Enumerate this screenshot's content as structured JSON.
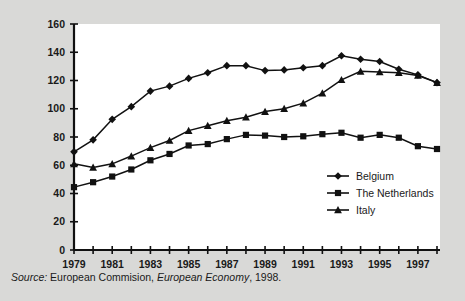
{
  "figure": {
    "background_color": "#d9d9d7",
    "plot_background_color": "#ffffff",
    "line_color": "#111111"
  },
  "source_note": {
    "prefix": "Source:",
    "body": " European Commision, ",
    "publication": "European Economy",
    "suffix": ", 1998."
  },
  "legend": {
    "position": "inside-right-lower",
    "entries": [
      {
        "label": "Belgium",
        "marker": "diamond"
      },
      {
        "label": "The Netherlands",
        "marker": "square"
      },
      {
        "label": "Italy",
        "marker": "triangle"
      }
    ]
  },
  "chart_data": {
    "type": "line",
    "title": "",
    "xlabel": "",
    "ylabel": "",
    "grid": false,
    "legend_position": "inside-right-lower",
    "x": [
      1979,
      1980,
      1981,
      1982,
      1983,
      1984,
      1985,
      1986,
      1987,
      1988,
      1989,
      1990,
      1991,
      1992,
      1993,
      1994,
      1995,
      1996,
      1997,
      1998
    ],
    "xlim": [
      1979,
      1998
    ],
    "xticks": [
      1979,
      1980,
      1981,
      1982,
      1983,
      1984,
      1985,
      1986,
      1987,
      1988,
      1989,
      1990,
      1991,
      1992,
      1993,
      1994,
      1995,
      1996,
      1997,
      1998
    ],
    "xticklabels": [
      "1979",
      "",
      "1981",
      "",
      "1983",
      "",
      "1985",
      "",
      "1987",
      "",
      "1989",
      "",
      "1991",
      "",
      "1993",
      "",
      "1995",
      "",
      "1997",
      ""
    ],
    "ylim": [
      0,
      160
    ],
    "yticks": [
      0,
      20,
      40,
      60,
      80,
      100,
      120,
      140,
      160
    ],
    "yticklabels": [
      "0",
      "20",
      "40",
      "60",
      "80",
      "100",
      "120",
      "140",
      "160"
    ],
    "series": [
      {
        "name": "Belgium",
        "marker": "diamond",
        "values": [
          69.5,
          78.0,
          92.5,
          101.5,
          112.5,
          116.0,
          121.5,
          125.5,
          130.5,
          130.5,
          127.0,
          127.5,
          129.0,
          130.5,
          137.5,
          135.0,
          133.5,
          128.0,
          124.0,
          118.5
        ]
      },
      {
        "name": "The Netherlands",
        "marker": "square",
        "values": [
          44.5,
          48.0,
          52.0,
          57.0,
          63.5,
          68.0,
          74.0,
          75.0,
          78.5,
          81.5,
          81.0,
          80.0,
          80.5,
          82.0,
          83.0,
          79.5,
          81.5,
          79.5,
          73.5,
          71.5
        ]
      },
      {
        "name": "Italy",
        "marker": "triangle",
        "values": [
          61.0,
          58.5,
          61.0,
          66.5,
          72.5,
          77.5,
          84.5,
          88.0,
          91.5,
          94.0,
          98.0,
          100.0,
          104.0,
          111.0,
          120.5,
          126.5,
          126.0,
          125.5,
          123.5,
          118.5
        ]
      }
    ]
  }
}
